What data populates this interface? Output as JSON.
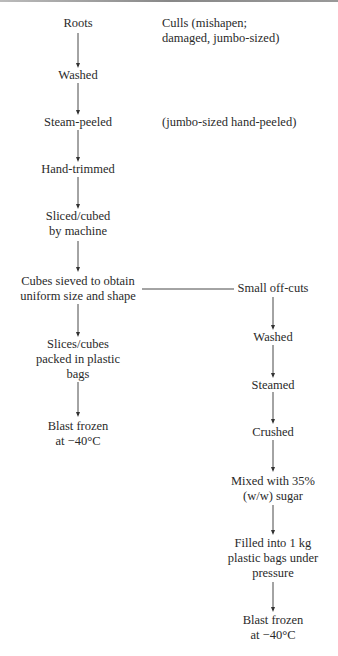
{
  "diagram": {
    "main_flow": [
      {
        "id": "roots",
        "lines": [
          "Roots"
        ]
      },
      {
        "id": "washed",
        "lines": [
          "Washed"
        ]
      },
      {
        "id": "steam-peeled",
        "lines": [
          "Steam-peeled"
        ]
      },
      {
        "id": "hand-trimmed",
        "lines": [
          "Hand-trimmed"
        ]
      },
      {
        "id": "sliced-cubed",
        "lines": [
          "Sliced/cubed",
          "by machine"
        ]
      },
      {
        "id": "cubes-sieved",
        "lines": [
          "Cubes sieved to obtain",
          "uniform size and shape"
        ]
      },
      {
        "id": "slices-packed",
        "lines": [
          "Slices/cubes",
          "packed in plastic",
          "bags"
        ]
      },
      {
        "id": "blast-frozen",
        "lines": [
          "Blast frozen",
          "at −40°C"
        ]
      }
    ],
    "side_flow": [
      {
        "id": "small-off-cuts",
        "lines": [
          "Small off-cuts"
        ]
      },
      {
        "id": "washed-2",
        "lines": [
          "Washed"
        ]
      },
      {
        "id": "steamed",
        "lines": [
          "Steamed"
        ]
      },
      {
        "id": "crushed",
        "lines": [
          "Crushed"
        ]
      },
      {
        "id": "mixed-sugar",
        "lines": [
          "Mixed with 35%",
          "(w/w) sugar"
        ]
      },
      {
        "id": "filled-bags",
        "lines": [
          "Filled into 1 kg",
          "plastic bags under",
          "pressure"
        ]
      },
      {
        "id": "blast-frozen-2",
        "lines": [
          "Blast frozen",
          "at −40°C"
        ]
      }
    ],
    "notes": [
      {
        "id": "culls-note",
        "lines": [
          "Culls (mishapen;",
          "damaged, jumbo-sized)"
        ]
      },
      {
        "id": "jumbo-note",
        "lines": [
          "(jumbo-sized hand-peeled)"
        ]
      }
    ]
  }
}
